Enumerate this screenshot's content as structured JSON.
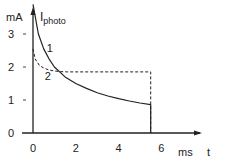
{
  "chart_data": {
    "type": "line",
    "title": "",
    "ylabel": "I_photo",
    "yunit": "mA",
    "xlabel": "t",
    "xunit": "ms",
    "xlim": [
      0,
      7
    ],
    "ylim": [
      0,
      3.8
    ],
    "xticks": [
      0,
      2,
      4,
      6
    ],
    "yticks": [
      0,
      1,
      2,
      3
    ],
    "grid": false,
    "series": [
      {
        "name": "1",
        "style": "solid",
        "x": [
          0,
          0.25,
          0.5,
          0.75,
          1,
          1.5,
          2,
          2.5,
          3,
          3.5,
          4,
          4.5,
          5,
          5.5,
          5.5
        ],
        "y": [
          3.9,
          3.0,
          2.55,
          2.25,
          2.0,
          1.7,
          1.5,
          1.35,
          1.22,
          1.12,
          1.04,
          0.97,
          0.91,
          0.86,
          0
        ]
      },
      {
        "name": "2",
        "style": "dashed",
        "x": [
          0,
          0.1,
          0.3,
          0.5,
          0.75,
          1,
          1.3,
          1.6,
          2,
          3,
          4,
          5,
          5.5,
          5.5
        ],
        "y": [
          2.55,
          2.25,
          2.05,
          1.97,
          1.91,
          1.88,
          1.86,
          1.85,
          1.85,
          1.85,
          1.85,
          1.85,
          1.85,
          0
        ]
      }
    ],
    "annotations": [
      {
        "text": "1",
        "x": 0.55,
        "y": 2.45
      },
      {
        "text": "2",
        "x": 0.45,
        "y": 1.6
      }
    ]
  }
}
